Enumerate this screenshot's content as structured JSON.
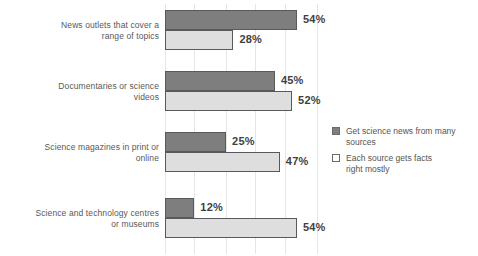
{
  "chart_data": {
    "type": "bar",
    "orientation": "horizontal",
    "title": "",
    "subtitle": "",
    "xlabel": "",
    "ylabel": "",
    "xlim": [
      0,
      60
    ],
    "grid": true,
    "gridlines_percent": [
      0,
      12,
      25,
      37,
      49,
      62
    ],
    "legend_position": "right",
    "categories": [
      "News outlets that cover a range of topics",
      "Documentaries or science videos",
      "Science magazines in print or online",
      "Science and technology centres or museums"
    ],
    "series": [
      {
        "name": "Get science news from many sources",
        "color": "#7e7e7e",
        "values": [
          54,
          45,
          25,
          12
        ],
        "labels": [
          "54%",
          "45%",
          "25%",
          "12%"
        ]
      },
      {
        "name": "Each source gets facts right mostly",
        "color": "#dedede",
        "values": [
          28,
          52,
          47,
          54
        ],
        "labels": [
          "28%",
          "52%",
          "47%",
          "54%"
        ]
      }
    ]
  },
  "rows": [
    {
      "label_line1": "News outlets that cover a",
      "label_line2": "range of topics",
      "dark_value": 54,
      "dark_label": "54%",
      "light_value": 28,
      "light_label": "28%"
    },
    {
      "label_line1": "Documentaries or science",
      "label_line2": "videos",
      "dark_value": 45,
      "dark_label": "45%",
      "light_value": 52,
      "light_label": "52%"
    },
    {
      "label_line1": "Science magazines in print or",
      "label_line2": "online",
      "dark_value": 25,
      "dark_label": "25%",
      "light_value": 47,
      "light_label": "47%"
    },
    {
      "label_line1": "Science and technology centres",
      "label_line2": "or museums",
      "dark_value": 12,
      "dark_label": "12%",
      "light_value": 54,
      "light_label": "54%"
    }
  ],
  "legend": {
    "items": [
      {
        "swatch": "dark-swatch-icon",
        "line1": "Get science news from many",
        "line2": "sources"
      },
      {
        "swatch": "light-swatch-icon",
        "line1": "Each source gets facts",
        "line2": "right mostly"
      }
    ]
  },
  "colors": {
    "dark_bar": "#7e7e7e",
    "light_bar": "#dedede",
    "bar_border": "#58595b",
    "gridline": "#e6e6e6",
    "text": "#595959",
    "value_text": "#3f3f3f",
    "background": "#ffffff"
  }
}
